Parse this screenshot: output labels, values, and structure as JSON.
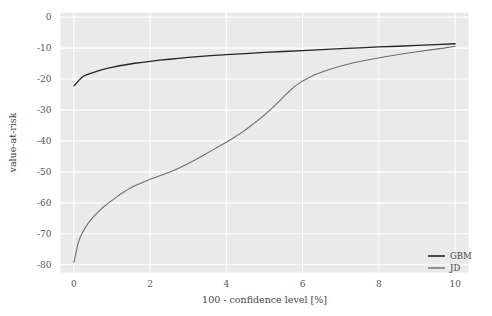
{
  "chart_data": {
    "type": "line",
    "title": "",
    "subtitle": "",
    "xlabel": "100 - confidence level [%]",
    "ylabel": "value-at-risk",
    "xlim": [
      -0.35,
      10.35
    ],
    "ylim": [
      -82.5,
      1.5
    ],
    "xticks": [
      0,
      2,
      4,
      6,
      8,
      10
    ],
    "xticklabels": [
      "0",
      "2",
      "4",
      "6",
      "8",
      "10"
    ],
    "yticks": [
      0,
      -10,
      -20,
      -30,
      -40,
      -50,
      -60,
      -70,
      -80
    ],
    "yticklabels": [
      "0",
      "-10",
      "-20",
      "-30",
      "-40",
      "-50",
      "-60",
      "-70",
      "-80"
    ],
    "grid": true,
    "grid_color": "#ffffff",
    "plot_background": "#eaeaea",
    "legend_position": "lower right",
    "legend_frame": false,
    "series": [
      {
        "name": "GBM",
        "color": "#262626",
        "linewidth": 1.3,
        "x": [
          0.0,
          0.05,
          0.1,
          0.15,
          0.2,
          0.25,
          0.3,
          0.4,
          0.5,
          0.6,
          0.7,
          0.8,
          0.9,
          1.0,
          1.2,
          1.4,
          1.6,
          1.8,
          2.0,
          2.25,
          2.5,
          2.75,
          3.0,
          3.5,
          4.0,
          4.5,
          5.0,
          5.5,
          6.0,
          6.5,
          7.0,
          7.5,
          8.0,
          8.5,
          9.0,
          9.5,
          10.0
        ],
        "y": [
          -22.2,
          -21.6,
          -20.9,
          -20.2,
          -19.6,
          -19.1,
          -18.8,
          -18.3,
          -17.9,
          -17.5,
          -17.1,
          -16.8,
          -16.5,
          -16.2,
          -15.7,
          -15.3,
          -14.9,
          -14.6,
          -14.3,
          -13.9,
          -13.6,
          -13.3,
          -13.0,
          -12.5,
          -12.1,
          -11.8,
          -11.4,
          -11.1,
          -10.8,
          -10.5,
          -10.2,
          -9.9,
          -9.6,
          -9.4,
          -9.1,
          -8.9,
          -8.6
        ]
      },
      {
        "name": "JD",
        "color": "#6e6e6e",
        "linewidth": 1.1,
        "x": [
          0.0,
          0.05,
          0.1,
          0.15,
          0.2,
          0.3,
          0.4,
          0.5,
          0.6,
          0.7,
          0.8,
          0.9,
          1.0,
          1.1,
          1.2,
          1.3,
          1.4,
          1.5,
          1.6,
          1.8,
          2.0,
          2.2,
          2.4,
          2.6,
          2.8,
          3.0,
          3.2,
          3.4,
          3.6,
          3.8,
          4.0,
          4.2,
          4.4,
          4.6,
          4.8,
          5.0,
          5.2,
          5.4,
          5.6,
          5.8,
          6.0,
          6.3,
          6.6,
          7.0,
          7.4,
          7.8,
          8.2,
          8.6,
          9.0,
          9.4,
          9.7,
          10.0
        ],
        "y": [
          -79.2,
          -76.5,
          -73.6,
          -71.6,
          -70.2,
          -68.0,
          -66.2,
          -64.7,
          -63.4,
          -62.2,
          -61.1,
          -60.1,
          -59.2,
          -58.3,
          -57.4,
          -56.6,
          -55.8,
          -55.1,
          -54.5,
          -53.4,
          -52.4,
          -51.5,
          -50.6,
          -49.6,
          -48.5,
          -47.3,
          -46.0,
          -44.6,
          -43.2,
          -41.8,
          -40.4,
          -38.9,
          -37.3,
          -35.5,
          -33.6,
          -31.6,
          -29.4,
          -27.0,
          -24.5,
          -22.3,
          -20.6,
          -18.7,
          -17.3,
          -15.8,
          -14.6,
          -13.6,
          -12.7,
          -11.9,
          -11.2,
          -10.5,
          -10.0,
          -9.4
        ]
      }
    ]
  },
  "legend": {
    "items": [
      {
        "label": "GBM",
        "color": "#262626"
      },
      {
        "label": "JD",
        "color": "#6e6e6e"
      }
    ]
  }
}
